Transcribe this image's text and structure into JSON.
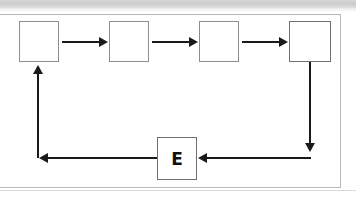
{
  "figure": {
    "type": "cycle-flowchart",
    "background_color": "#ffffff",
    "top_band_color": "#d6d6d6",
    "frame_border_color": "#b9b9b9",
    "connector_color": "#1a1a1a",
    "node_border_color": "#8d8d8d"
  },
  "nodes": [
    {
      "id": "node-1",
      "label": "",
      "x": 19,
      "y": 21,
      "w": 40,
      "h": 41
    },
    {
      "id": "node-2",
      "label": "",
      "x": 109,
      "y": 21,
      "w": 40,
      "h": 41
    },
    {
      "id": "node-3",
      "label": "",
      "x": 199,
      "y": 21,
      "w": 40,
      "h": 41
    },
    {
      "id": "node-4",
      "label": "",
      "x": 289,
      "y": 21,
      "w": 42,
      "h": 41
    },
    {
      "id": "node-e",
      "label": "E",
      "x": 157,
      "y": 137,
      "w": 40,
      "h": 43
    }
  ],
  "connectors": [
    {
      "id": "arrow-1-to-2",
      "from": "node-1",
      "to": "node-2",
      "direction": "right"
    },
    {
      "id": "arrow-2-to-3",
      "from": "node-2",
      "to": "node-3",
      "direction": "right"
    },
    {
      "id": "arrow-3-to-4",
      "from": "node-3",
      "to": "node-4",
      "direction": "right"
    },
    {
      "id": "arrow-4-down",
      "from": "node-4",
      "to": "bottom-rail",
      "direction": "down"
    },
    {
      "id": "arrow-rail-to-e",
      "from": "bottom-rail",
      "to": "node-e",
      "direction": "left"
    },
    {
      "id": "arrow-e-to-left-rail",
      "from": "node-e",
      "to": "left-rail",
      "direction": "left"
    },
    {
      "id": "arrow-up-to-1",
      "from": "left-rail",
      "to": "node-1",
      "direction": "up"
    }
  ]
}
